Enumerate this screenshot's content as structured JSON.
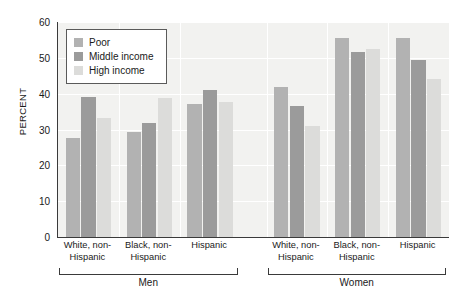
{
  "chart_data": {
    "type": "bar",
    "title": "",
    "xlabel": "",
    "ylabel": "PERCENT",
    "ylim": [
      0,
      60
    ],
    "yticks": [
      0,
      10,
      20,
      30,
      40,
      50,
      60
    ],
    "grid": true,
    "legend_position": "top-left",
    "categories": [
      "White, non-Hispanic",
      "Black, non-Hispanic",
      "Hispanic",
      "White, non-Hispanic",
      "Black, non-Hispanic",
      "Hispanic"
    ],
    "category_lines": [
      [
        "White, non-",
        "Hispanic"
      ],
      [
        "Black, non-",
        "Hispanic"
      ],
      [
        "Hispanic",
        ""
      ],
      [
        "White, non-",
        "Hispanic"
      ],
      [
        "Black, non-",
        "Hispanic"
      ],
      [
        "Hispanic",
        ""
      ]
    ],
    "groups": [
      {
        "label": "Men",
        "category_indices": [
          0,
          1,
          2
        ]
      },
      {
        "label": "Women",
        "category_indices": [
          3,
          4,
          5
        ]
      }
    ],
    "series": [
      {
        "name": "Poor",
        "color": "#b2b2b2",
        "values": [
          27.5,
          29.3,
          37.0,
          42.0,
          55.5,
          55.5
        ]
      },
      {
        "name": "Middle income",
        "color": "#9b9b9b",
        "values": [
          39.0,
          31.7,
          41.0,
          36.5,
          51.5,
          49.5
        ]
      },
      {
        "name": "High income",
        "color": "#dcdcda",
        "values": [
          33.2,
          38.8,
          37.8,
          31.0,
          52.5,
          44.0
        ]
      }
    ]
  },
  "legend": {
    "items": [
      {
        "label": "Poor",
        "color": "#b2b2b2"
      },
      {
        "label": "Middle income",
        "color": "#9b9b9b"
      },
      {
        "label": "High income",
        "color": "#dcdcda"
      }
    ]
  },
  "axis": {
    "y_title": "PERCENT"
  }
}
